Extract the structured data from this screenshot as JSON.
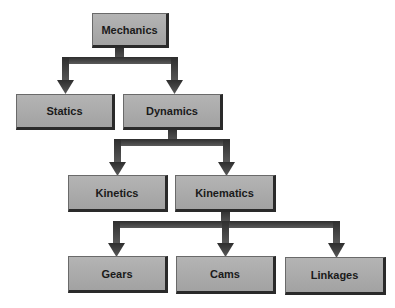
{
  "diagram": {
    "type": "hierarchy-tree",
    "colors": {
      "background": "#ffffff",
      "node_fill": "#aaaaaa",
      "node_border": "#2a2a2a",
      "arrow": "#3a3a3a",
      "text": "#1a1a1a"
    },
    "nodes": {
      "mechanics": "Mechanics",
      "statics": "Statics",
      "dynamics": "Dynamics",
      "kinetics": "Kinetics",
      "kinematics": "Kinematics",
      "gears": "Gears",
      "cams": "Cams",
      "linkages": "Linkages"
    },
    "edges": [
      [
        "Mechanics",
        "Statics"
      ],
      [
        "Mechanics",
        "Dynamics"
      ],
      [
        "Dynamics",
        "Kinetics"
      ],
      [
        "Dynamics",
        "Kinematics"
      ],
      [
        "Kinematics",
        "Gears"
      ],
      [
        "Kinematics",
        "Cams"
      ],
      [
        "Kinematics",
        "Linkages"
      ]
    ]
  }
}
